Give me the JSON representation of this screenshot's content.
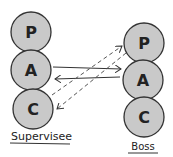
{
  "diagram": {
    "colors": {
      "circle_fill": "#c9c9c9",
      "stroke": "#333333",
      "letter": "#2e2e2e"
    },
    "left_column": {
      "label": "Supervisee",
      "circles": [
        {
          "letter": "P"
        },
        {
          "letter": "A"
        },
        {
          "letter": "C"
        }
      ]
    },
    "right_column": {
      "label": "Boss",
      "circles": [
        {
          "letter": "P"
        },
        {
          "letter": "A"
        },
        {
          "letter": "C"
        }
      ]
    },
    "arrows": [
      {
        "from": "Supervisee A",
        "to": "Boss A",
        "style": "solid"
      },
      {
        "from": "Boss A",
        "to": "Supervisee A",
        "style": "solid"
      },
      {
        "from": "Supervisee A",
        "to": "Boss P",
        "style": "dashed"
      },
      {
        "from": "Boss P",
        "to": "Supervisee C",
        "style": "dashed"
      }
    ]
  }
}
